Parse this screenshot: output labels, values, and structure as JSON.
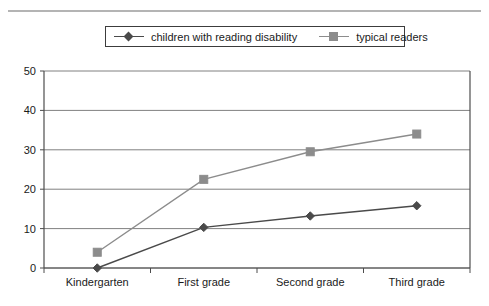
{
  "chart_data": {
    "type": "line",
    "title": "",
    "subtitle": "",
    "xlabel": "",
    "ylabel": "",
    "categories": [
      "Kindergarten",
      "First grade",
      "Second grade",
      "Third grade"
    ],
    "series": [
      {
        "name": "children with reading disability",
        "values": [
          0,
          10.3,
          13.2,
          15.8
        ],
        "color": "#4a4a4a",
        "marker": "diamond"
      },
      {
        "name": "typical readers",
        "values": [
          4,
          22.5,
          29.5,
          34
        ],
        "color": "#8c8c8c",
        "marker": "square"
      }
    ],
    "ylim": [
      0,
      50
    ],
    "yticks": [
      0,
      10,
      20,
      30,
      40,
      50
    ],
    "ytick_labels": [
      "0",
      "10",
      "20",
      "30",
      "40",
      "50"
    ],
    "grid": true,
    "grid_axis": "y",
    "legend_position": "top-center"
  },
  "legend": {
    "entries": [
      {
        "label": "children with reading disability",
        "marker": "diamond-marker-icon"
      },
      {
        "label": "typical readers",
        "marker": "square-marker-icon"
      }
    ]
  },
  "colors": {
    "series_reading_disability": "#4a4a4a",
    "series_typical_readers": "#8c8c8c",
    "axis": "#4d4d4d",
    "grid": "#808080",
    "top_rule": "#b4b4b4",
    "text": "#1a1a1a",
    "background": "#ffffff"
  }
}
